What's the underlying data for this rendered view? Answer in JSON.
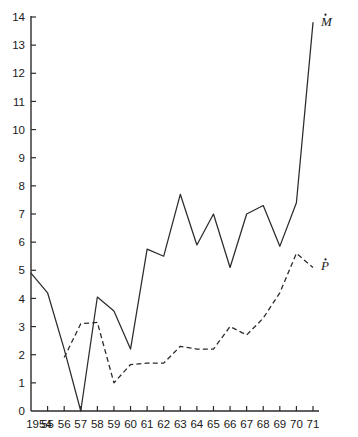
{
  "chart_data": {
    "type": "line",
    "title": "",
    "xlabel": "",
    "ylabel": "",
    "xlim": [
      1954,
      1971
    ],
    "ylim": [
      0,
      14
    ],
    "grid": false,
    "legend_position": "inline-right-end-of-series",
    "x": [
      1954,
      1955,
      1956,
      1957,
      1958,
      1959,
      1960,
      1961,
      1962,
      1963,
      1964,
      1965,
      1966,
      1967,
      1968,
      1969,
      1970,
      1971
    ],
    "xtick_labels": [
      "1954",
      "55",
      "56",
      "57",
      "58",
      "59",
      "60",
      "61",
      "62",
      "63",
      "64",
      "65",
      "66",
      "67",
      "68",
      "69",
      "70",
      "71"
    ],
    "ytick_labels": [
      "0",
      "1",
      "2",
      "3",
      "4",
      "5",
      "6",
      "7",
      "8",
      "9",
      "10",
      "11",
      "12",
      "13",
      "14"
    ],
    "ytick_values": [
      0,
      1,
      2,
      3,
      4,
      5,
      6,
      7,
      8,
      9,
      10,
      11,
      12,
      13,
      14
    ],
    "series": [
      {
        "name": "M-dot",
        "label": "M",
        "label_accent": "dot",
        "style": "solid",
        "color": "#2b2b2b",
        "x": [
          1954,
          1955,
          1956,
          1957,
          1958,
          1959,
          1960,
          1961,
          1962,
          1963,
          1964,
          1965,
          1966,
          1967,
          1968,
          1969,
          1970,
          1971
        ],
        "values": [
          4.9,
          4.2,
          2.2,
          0.0,
          4.05,
          3.55,
          2.2,
          5.75,
          5.5,
          7.7,
          5.9,
          7.0,
          5.1,
          7.0,
          7.3,
          5.85,
          7.4,
          13.8
        ]
      },
      {
        "name": "P-dot",
        "label": "P",
        "label_accent": "dot",
        "style": "dashed",
        "color": "#2b2b2b",
        "x": [
          1956,
          1957,
          1958,
          1959,
          1960,
          1961,
          1962,
          1963,
          1964,
          1965,
          1966,
          1967,
          1968,
          1969,
          1970,
          1971
        ],
        "values": [
          1.9,
          3.1,
          3.15,
          1.0,
          1.65,
          1.7,
          1.7,
          2.3,
          2.2,
          2.2,
          3.0,
          2.7,
          3.3,
          4.2,
          5.6,
          5.1
        ]
      }
    ]
  },
  "axes": {
    "y_axis_name": "y-axis",
    "x_axis_name": "x-axis"
  }
}
